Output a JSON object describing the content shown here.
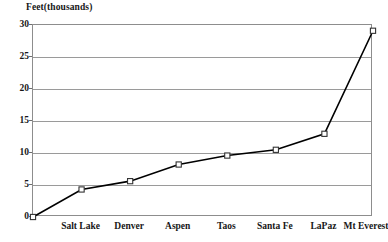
{
  "chart_data": {
    "type": "line",
    "title": "",
    "axis_title": "Feet(thousands)",
    "xlabel": "",
    "ylabel": "Feet(thousands)",
    "categories": [
      "",
      "Salt Lake",
      "Denver",
      "Aspen",
      "Taos",
      "Santa Fe",
      "LaPaz",
      "Mt Everest"
    ],
    "values": [
      0,
      4.3,
      5.6,
      8.2,
      9.6,
      10.5,
      13.0,
      29.1
    ],
    "series": [
      {
        "name": "Elevation",
        "values": [
          0,
          4.3,
          5.6,
          8.2,
          9.6,
          10.5,
          13.0,
          29.1
        ]
      }
    ],
    "ylim": [
      0,
      30
    ],
    "yticks": [
      0,
      5,
      10,
      15,
      20,
      25,
      30
    ],
    "ytick_labels": [
      "0",
      "5",
      "10",
      "15",
      "20",
      "25",
      "30"
    ],
    "grid": true,
    "legend": false,
    "legend_position": "none",
    "marker": "open-square",
    "line_color": "#000000",
    "grid_color": "#9a9a9a",
    "frame_color": "#8d8d8d",
    "marker_fill": "#ffffff",
    "marker_stroke": "#333333"
  }
}
